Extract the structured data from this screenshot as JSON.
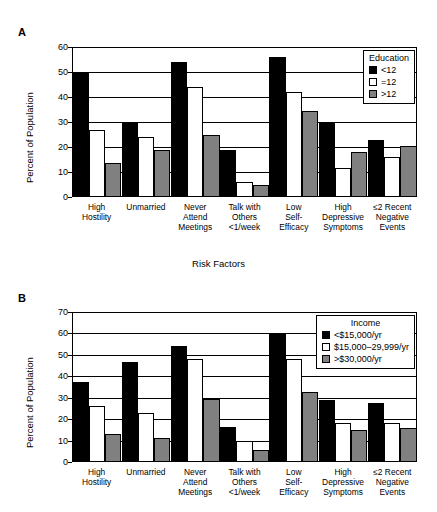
{
  "figure": {
    "axis_title": "Risk Factors",
    "panel_a_letter": "A",
    "panel_b_letter": "B"
  },
  "chart_data": [
    {
      "type": "bar",
      "panel": "A",
      "title": "",
      "xlabel": "Risk Factors",
      "ylabel": "Percent of Population",
      "ylim": [
        0,
        60
      ],
      "yticks": [
        0,
        10,
        20,
        30,
        40,
        50,
        60
      ],
      "grid": true,
      "legend_position": "top-right",
      "legend_title": "Education",
      "categories": [
        "High\nHostility",
        "Unmarried",
        "Never\nAttend\nMeetings",
        "Talk with\nOthers\n<1/week",
        "Low\nSelf-\nEfficacy",
        "High\nDepressive\nSymptoms",
        "≤2 Recent\nNegative\nEvents"
      ],
      "series": [
        {
          "name": "<12",
          "color": "#000000",
          "values": [
            50,
            30,
            54,
            19,
            56,
            30,
            23
          ]
        },
        {
          "name": "=12",
          "color": "#ffffff",
          "values": [
            27,
            24,
            44,
            6,
            42,
            11.5,
            16
          ]
        },
        {
          "name": ">12",
          "color": "#808080",
          "values": [
            13.5,
            19,
            25,
            5,
            34.5,
            18,
            20.5
          ]
        }
      ]
    },
    {
      "type": "bar",
      "panel": "B",
      "title": "",
      "xlabel": "Risk Factors",
      "ylabel": "Percent of Population",
      "ylim": [
        0,
        70
      ],
      "yticks": [
        0,
        10,
        20,
        30,
        40,
        50,
        60,
        70
      ],
      "grid": true,
      "legend_position": "top-right",
      "legend_title": "Income",
      "categories": [
        "High\nHostility",
        "Unmarried",
        "Never\nAttend\nMeetings",
        "Talk with\nOthers\n<1/week",
        "Low\nSelf-\nEfficacy",
        "High\nDepressive\nSymptoms",
        "≤2 Recent\nNegative\nEvents"
      ],
      "series": [
        {
          "name": "<$15,000/yr",
          "color": "#000000",
          "values": [
            37.5,
            46.5,
            54,
            16.5,
            60,
            29,
            27.5
          ]
        },
        {
          "name": "$15,000–29,999/yr",
          "color": "#ffffff",
          "values": [
            26,
            23,
            48,
            10,
            48,
            18,
            18
          ]
        },
        {
          "name": ">$30,000/yr",
          "color": "#808080",
          "values": [
            13,
            11,
            29.5,
            5.5,
            32.5,
            15,
            16
          ]
        }
      ]
    }
  ]
}
